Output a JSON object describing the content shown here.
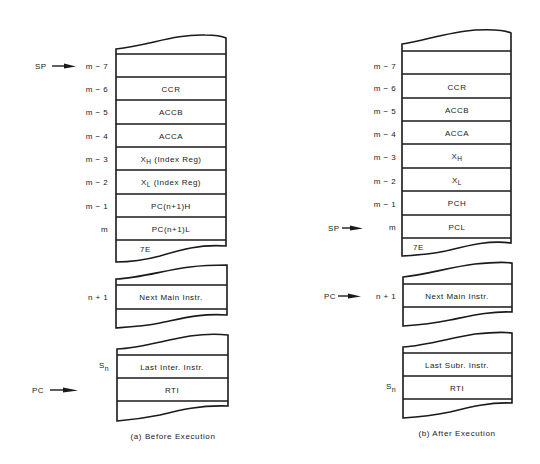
{
  "panels": [
    {
      "id": "before",
      "caption": "(a) Before Execution",
      "stack": {
        "cells": [
          {
            "addr": "m − 7",
            "content": ""
          },
          {
            "addr": "m − 6",
            "content": "CCR"
          },
          {
            "addr": "m − 5",
            "content": "ACCB"
          },
          {
            "addr": "m − 4",
            "content": "ACCA"
          },
          {
            "addr": "m − 3",
            "content_main": "X",
            "content_sub": "H",
            "content_rest": " (Index Reg)"
          },
          {
            "addr": "m − 2",
            "content_main": "X",
            "content_sub": "L",
            "content_rest": " (Index Reg)"
          },
          {
            "addr": "m − 1",
            "content": "PC(n+1)H"
          },
          {
            "addr": "m",
            "content": "PC(n+1)L"
          },
          {
            "addr": "",
            "content": "7E"
          }
        ]
      },
      "main_program": {
        "addr": "n + 1",
        "content": "Next Main Instr."
      },
      "interrupt_routine": {
        "cells": [
          {
            "addr_main": "S",
            "addr_sub": "n",
            "content": "Last Inter. Instr."
          },
          {
            "addr": "",
            "content": "RTI"
          }
        ]
      },
      "pointers": {
        "sp": {
          "label": "SP",
          "points_to": "m − 7"
        },
        "pc": {
          "label": "PC",
          "points_to": "RTI"
        }
      }
    },
    {
      "id": "after",
      "caption": "(b) After Execution",
      "stack": {
        "cells": [
          {
            "addr": "m − 7",
            "content": ""
          },
          {
            "addr": "m − 6",
            "content": "CCR"
          },
          {
            "addr": "m − 5",
            "content": "ACCB"
          },
          {
            "addr": "m − 4",
            "content": "ACCA"
          },
          {
            "addr": "m − 3",
            "content_main": "X",
            "content_sub": "H",
            "content_rest": ""
          },
          {
            "addr": "m − 2",
            "content_main": "X",
            "content_sub": "L",
            "content_rest": ""
          },
          {
            "addr": "m − 1",
            "content": "PCH"
          },
          {
            "addr": "m",
            "content": "PCL"
          },
          {
            "addr": "",
            "content": "7E"
          }
        ]
      },
      "main_program": {
        "addr": "n + 1",
        "content": "Next Main Instr."
      },
      "interrupt_routine": {
        "cells": [
          {
            "addr": "",
            "content": "Last Subr. Instr."
          },
          {
            "addr_main": "S",
            "addr_sub": "n",
            "content": "RTI"
          }
        ]
      },
      "pointers": {
        "sp": {
          "label": "SP",
          "points_to": "m"
        },
        "pc": {
          "label": "PC",
          "points_to": "n + 1"
        }
      }
    }
  ]
}
